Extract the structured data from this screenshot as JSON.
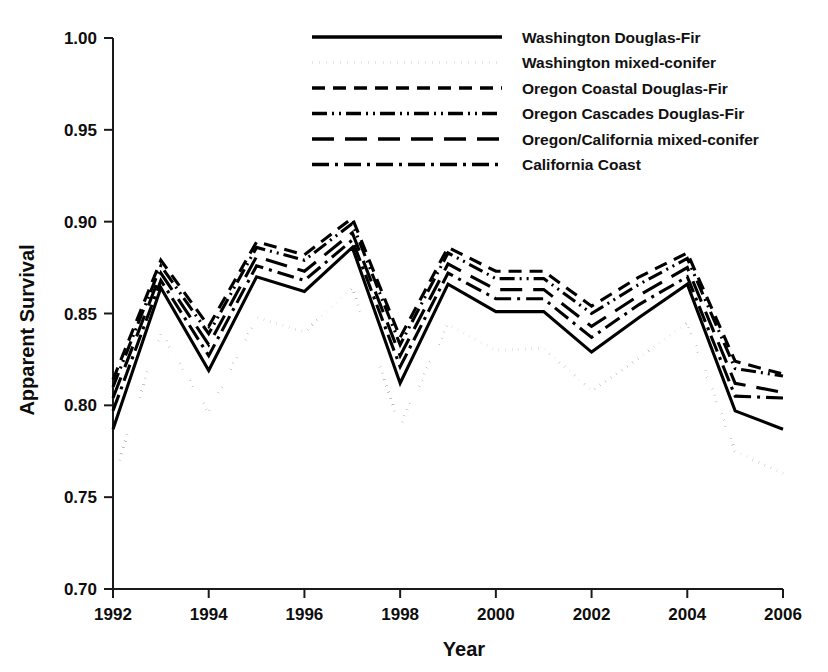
{
  "chart_data": {
    "type": "line",
    "title": "",
    "xlabel": "Year",
    "ylabel": "Apparent Survival",
    "x": [
      1992,
      1993,
      1994,
      1995,
      1996,
      1997,
      1998,
      1999,
      2000,
      2001,
      2002,
      2003,
      2004,
      2005,
      2006
    ],
    "xlim": [
      1992,
      2006
    ],
    "ylim": [
      0.7,
      1.0
    ],
    "xticks": [
      1992,
      1994,
      1996,
      1998,
      2000,
      2002,
      2004,
      2006
    ],
    "xtick_labels": [
      "1992",
      "1994",
      "1996",
      "1998",
      "2000",
      "2002",
      "2004",
      "2006"
    ],
    "yticks": [
      0.7,
      0.75,
      0.8,
      0.85,
      0.9,
      0.95,
      1.0
    ],
    "ytick_labels": [
      "0.70",
      "0.75",
      "0.80",
      "0.85",
      "0.90",
      "0.95",
      "1.00"
    ],
    "grid": false,
    "legend_position": "top-center",
    "series": [
      {
        "name": "Washington Douglas-Fir",
        "style": "solid",
        "dash": "none",
        "values": [
          0.787,
          0.864,
          0.819,
          0.87,
          0.862,
          0.886,
          0.812,
          0.866,
          0.851,
          0.851,
          0.829,
          0.848,
          0.866,
          0.797,
          0.787
        ]
      },
      {
        "name": "Washington mixed-conifer",
        "style": "dotted",
        "dash": "1,6",
        "values": [
          0.76,
          0.84,
          0.796,
          0.848,
          0.84,
          0.864,
          0.789,
          0.844,
          0.83,
          0.831,
          0.808,
          0.826,
          0.845,
          0.775,
          0.763
        ]
      },
      {
        "name": "Oregon Coastal Douglas-Fir",
        "style": "dashed",
        "dash": "13,8",
        "values": [
          0.814,
          0.879,
          0.843,
          0.889,
          0.882,
          0.902,
          0.837,
          0.886,
          0.873,
          0.873,
          0.854,
          0.87,
          0.883,
          0.824,
          0.817
        ]
      },
      {
        "name": "Oregon Cascades Douglas-Fir",
        "style": "dash-dot-dot",
        "dash": "15,5,2,5,2,5",
        "values": [
          0.81,
          0.876,
          0.839,
          0.886,
          0.879,
          0.899,
          0.833,
          0.883,
          0.869,
          0.869,
          0.85,
          0.866,
          0.88,
          0.82,
          0.816
        ]
      },
      {
        "name": "Oregon/California mixed-conifer",
        "style": "long-dash",
        "dash": "22,11",
        "values": [
          0.804,
          0.872,
          0.833,
          0.881,
          0.873,
          0.894,
          0.827,
          0.877,
          0.863,
          0.863,
          0.843,
          0.86,
          0.875,
          0.812,
          0.807
        ]
      },
      {
        "name": "California Coast",
        "style": "dash-dot",
        "dash": "17,6,3,6",
        "values": [
          0.797,
          0.868,
          0.827,
          0.876,
          0.868,
          0.89,
          0.821,
          0.872,
          0.858,
          0.858,
          0.837,
          0.855,
          0.87,
          0.805,
          0.804
        ]
      }
    ]
  },
  "legend": {
    "items": [
      {
        "label": "Washington Douglas-Fir"
      },
      {
        "label": "Washington mixed-conifer"
      },
      {
        "label": "Oregon Coastal Douglas-Fir"
      },
      {
        "label": "Oregon Cascades Douglas-Fir"
      },
      {
        "label": "Oregon/California mixed-conifer"
      },
      {
        "label": "California Coast"
      }
    ]
  },
  "axes": {
    "y_title": "Apparent Survival",
    "x_title": "Year"
  },
  "colors": {
    "ink": "#000000",
    "axis": "#1a1a1a",
    "background": "#ffffff"
  }
}
